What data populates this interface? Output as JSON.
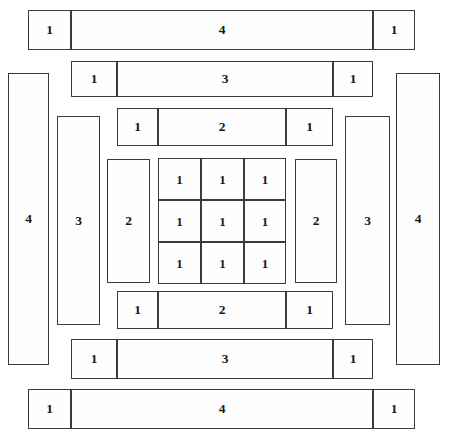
{
  "diagram": {
    "width": 452,
    "height": 440,
    "background_color": "#ffffff",
    "stroke_color": "#3b3b3b",
    "label_color": "#17171a",
    "tiles": [
      {
        "name": "top-row-left-square-1",
        "label": "1",
        "x": 28,
        "y": 10,
        "w": 43,
        "h": 40
      },
      {
        "name": "top-row-bar-4",
        "label": "4",
        "x": 71,
        "y": 10,
        "w": 302,
        "h": 40
      },
      {
        "name": "top-row-right-square-1",
        "label": "1",
        "x": 373,
        "y": 10,
        "w": 42,
        "h": 40
      },
      {
        "name": "second-row-left-square-1",
        "label": "1",
        "x": 71,
        "y": 61,
        "w": 46,
        "h": 36
      },
      {
        "name": "second-row-bar-3",
        "label": "3",
        "x": 117,
        "y": 61,
        "w": 216,
        "h": 36
      },
      {
        "name": "second-row-right-square-1",
        "label": "1",
        "x": 333,
        "y": 61,
        "w": 40,
        "h": 36
      },
      {
        "name": "third-row-left-square-1",
        "label": "1",
        "x": 117,
        "y": 108,
        "w": 41,
        "h": 38
      },
      {
        "name": "third-row-bar-2",
        "label": "2",
        "x": 158,
        "y": 108,
        "w": 128,
        "h": 38
      },
      {
        "name": "third-row-right-square-1",
        "label": "1",
        "x": 286,
        "y": 108,
        "w": 47,
        "h": 38
      },
      {
        "name": "left-outer-column-4",
        "label": "4",
        "x": 8,
        "y": 73,
        "w": 41,
        "h": 292
      },
      {
        "name": "left-inner-column-3",
        "label": "3",
        "x": 57,
        "y": 116,
        "w": 43,
        "h": 209
      },
      {
        "name": "left-core-column-2",
        "label": "2",
        "x": 107,
        "y": 159,
        "w": 43,
        "h": 124
      },
      {
        "name": "right-core-column-2",
        "label": "2",
        "x": 295,
        "y": 159,
        "w": 42,
        "h": 124
      },
      {
        "name": "right-inner-column-3",
        "label": "3",
        "x": 345,
        "y": 116,
        "w": 45,
        "h": 209
      },
      {
        "name": "right-outer-column-4",
        "label": "4",
        "x": 396,
        "y": 73,
        "w": 44,
        "h": 292
      },
      {
        "name": "center-cell-r1c1",
        "label": "1",
        "x": 158,
        "y": 158,
        "w": 43,
        "h": 42
      },
      {
        "name": "center-cell-r1c2",
        "label": "1",
        "x": 201,
        "y": 158,
        "w": 43,
        "h": 42
      },
      {
        "name": "center-cell-r1c3",
        "label": "1",
        "x": 244,
        "y": 158,
        "w": 42,
        "h": 42
      },
      {
        "name": "center-cell-r2c1",
        "label": "1",
        "x": 158,
        "y": 200,
        "w": 43,
        "h": 42
      },
      {
        "name": "center-cell-r2c2",
        "label": "1",
        "x": 201,
        "y": 200,
        "w": 43,
        "h": 42
      },
      {
        "name": "center-cell-r2c3",
        "label": "1",
        "x": 244,
        "y": 200,
        "w": 42,
        "h": 42
      },
      {
        "name": "center-cell-r3c1",
        "label": "1",
        "x": 158,
        "y": 242,
        "w": 43,
        "h": 42
      },
      {
        "name": "center-cell-r3c2",
        "label": "1",
        "x": 201,
        "y": 242,
        "w": 43,
        "h": 42
      },
      {
        "name": "center-cell-r3c3",
        "label": "1",
        "x": 244,
        "y": 242,
        "w": 42,
        "h": 42
      },
      {
        "name": "bottom-third-row-left-square-1",
        "label": "1",
        "x": 117,
        "y": 291,
        "w": 41,
        "h": 38
      },
      {
        "name": "bottom-third-row-bar-2",
        "label": "2",
        "x": 158,
        "y": 291,
        "w": 128,
        "h": 38
      },
      {
        "name": "bottom-third-row-right-square-1",
        "label": "1",
        "x": 286,
        "y": 291,
        "w": 47,
        "h": 38
      },
      {
        "name": "bottom-second-row-left-square-1",
        "label": "1",
        "x": 71,
        "y": 339,
        "w": 46,
        "h": 40
      },
      {
        "name": "bottom-second-row-bar-3",
        "label": "3",
        "x": 117,
        "y": 339,
        "w": 216,
        "h": 40
      },
      {
        "name": "bottom-second-row-right-square-1",
        "label": "1",
        "x": 333,
        "y": 339,
        "w": 40,
        "h": 40
      },
      {
        "name": "bottom-row-left-square-1",
        "label": "1",
        "x": 28,
        "y": 389,
        "w": 43,
        "h": 40
      },
      {
        "name": "bottom-row-bar-4",
        "label": "4",
        "x": 71,
        "y": 389,
        "w": 302,
        "h": 40
      },
      {
        "name": "bottom-row-right-square-1",
        "label": "1",
        "x": 373,
        "y": 389,
        "w": 42,
        "h": 40
      }
    ]
  }
}
